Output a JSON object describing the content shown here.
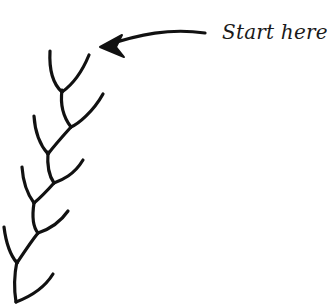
{
  "diagram": {
    "label": "Start here",
    "stroke_color": "#111111",
    "background": "#ffffff"
  }
}
